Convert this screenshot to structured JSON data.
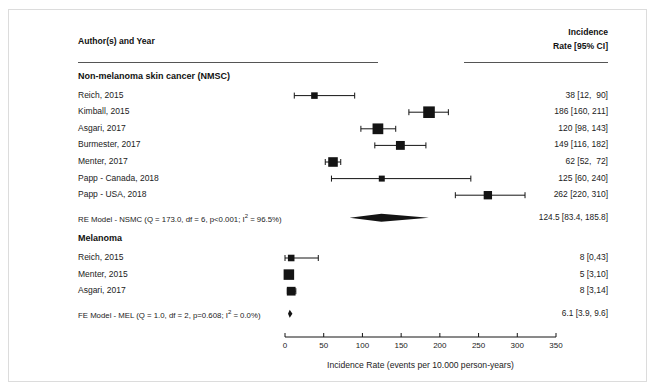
{
  "figure": {
    "header": {
      "left_column": "Author(s) and Year",
      "right_column_line1": "Incidence",
      "right_column_line2": "Rate [95% CI]"
    },
    "axis_caption": "Incidence Rate (events per 10.000 person-years)"
  },
  "chart_data": {
    "type": "forest",
    "title": "",
    "xlabel": "Incidence Rate (events per 10.000 person-years)",
    "ylabel": "",
    "xlim": [
      0,
      350
    ],
    "xticks": [
      0,
      50,
      100,
      150,
      200,
      250,
      300,
      350
    ],
    "xtick_labels": [
      "0",
      "50",
      "100",
      "150",
      "200",
      "250",
      "300",
      "350"
    ],
    "grid": false,
    "legend": "none",
    "groups": [
      {
        "name": "Non-melanoma skin cancer (NMSC)",
        "rows": [
          {
            "label": "Reich, 2015",
            "estimate": 38,
            "ci_low": 12,
            "ci_high": 90,
            "value_text": "38 [12,  90]",
            "weight": 0.3
          },
          {
            "label": "Kimball, 2015",
            "estimate": 186,
            "ci_low": 160,
            "ci_high": 211,
            "value_text": "186 [160, 211]",
            "weight": 1.0
          },
          {
            "label": "Asgari, 2017",
            "estimate": 120,
            "ci_low": 98,
            "ci_high": 143,
            "value_text": "120 [98, 143]",
            "weight": 0.88
          },
          {
            "label": "Burmester, 2017",
            "estimate": 149,
            "ci_low": 116,
            "ci_high": 182,
            "value_text": "149 [116, 182]",
            "weight": 0.62
          },
          {
            "label": "Menter, 2017",
            "estimate": 62,
            "ci_low": 52,
            "ci_high": 72,
            "value_text": "62 [52,  72]",
            "weight": 0.72
          },
          {
            "label": "Papp - Canada, 2018",
            "estimate": 125,
            "ci_low": 60,
            "ci_high": 240,
            "value_text": "125 [60, 240]",
            "weight": 0.22
          },
          {
            "label": "Papp - USA, 2018",
            "estimate": 262,
            "ci_low": 220,
            "ci_high": 310,
            "value_text": "262 [220, 310]",
            "weight": 0.55
          }
        ],
        "summary": {
          "label": "RE Model - NSMC (Q = 173.0, df = 6, p<0.001; I2 = 96.5%)",
          "label_prefix": "RE Model - NSMC (Q = 173.0, df = 6, p<0.001; I",
          "label_suffix": " = 96.5%)",
          "estimate": 124.5,
          "ci_low": 83.4,
          "ci_high": 185.8,
          "value_text": "124.5 [83.4, 185.8]",
          "Q": "173.0",
          "df": "6",
          "p": "<0.001",
          "I2": "96.5%"
        }
      },
      {
        "name": "Melanoma",
        "rows": [
          {
            "label": "Reich, 2015",
            "estimate": 8,
            "ci_low": 0,
            "ci_high": 43,
            "value_text": "8 [0,43]",
            "weight": 0.3
          },
          {
            "label": "Menter, 2015",
            "estimate": 5,
            "ci_low": 3,
            "ci_high": 10,
            "value_text": "5 [3,10]",
            "weight": 0.85
          },
          {
            "label": "Asgari, 2017",
            "estimate": 8,
            "ci_low": 3,
            "ci_high": 14,
            "value_text": "8 [3,14]",
            "weight": 0.6
          }
        ],
        "summary": {
          "label": "FE Model - MEL (Q = 1.0, df = 2, p=0.608; I2 = 0.0%)",
          "label_prefix": "FE Model - MEL (Q = 1.0, df = 2, p=0.608; I",
          "label_suffix": " = 0.0%)",
          "estimate": 6.1,
          "ci_low": 3.9,
          "ci_high": 9.6,
          "value_text": "6.1 [3.9, 9.6]",
          "Q": "1.0",
          "df": "2",
          "p": "0.608",
          "I2": "0.0%"
        }
      }
    ]
  },
  "colors": {
    "marker": "#141414",
    "line": "#141414",
    "text": "#222222",
    "rule": "#555555",
    "frame": "#dcdcdc"
  }
}
